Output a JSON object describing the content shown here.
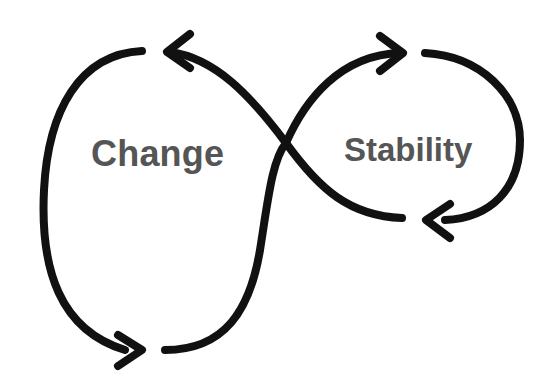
{
  "diagram": {
    "type": "figure-eight cycle",
    "left_loop": {
      "label": "Change"
    },
    "right_loop": {
      "label": "Stability"
    },
    "stroke_color": "#111111",
    "text_color": "#555555",
    "background": "#ffffff",
    "arrows": [
      {
        "position": "top-left",
        "direction": "left"
      },
      {
        "position": "top-right",
        "direction": "right"
      },
      {
        "position": "bottom-left",
        "direction": "right"
      },
      {
        "position": "bottom-right",
        "direction": "left"
      }
    ]
  }
}
